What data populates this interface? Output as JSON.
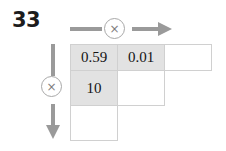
{
  "problem": {
    "number": "33"
  },
  "operators": {
    "horizontal": {
      "symbol": "×",
      "icon": "multiply-icon",
      "direction": "right"
    },
    "vertical": {
      "symbol": "×",
      "icon": "multiply-icon",
      "direction": "down"
    }
  },
  "grid": {
    "rows": [
      {
        "cells": [
          {
            "value": "0.59",
            "state": "filled"
          },
          {
            "value": "0.01",
            "state": "filled"
          },
          {
            "value": "",
            "state": "blank"
          }
        ]
      },
      {
        "cells": [
          {
            "value": "10",
            "state": "filled"
          },
          {
            "value": "",
            "state": "blank"
          },
          {
            "value": "",
            "state": "spacer"
          }
        ]
      },
      {
        "cells": [
          {
            "value": "",
            "state": "blank"
          },
          {
            "value": "",
            "state": "spacer"
          },
          {
            "value": "",
            "state": "spacer"
          }
        ]
      }
    ]
  },
  "colors": {
    "filled_cell": "#e2e2e2",
    "blank_cell": "#ffffff",
    "cell_border": "#d0d0d0",
    "arrow": "#9a9a9a",
    "circle_border": "#a8a8a8",
    "text": "#141414",
    "background": "#ffffff"
  }
}
